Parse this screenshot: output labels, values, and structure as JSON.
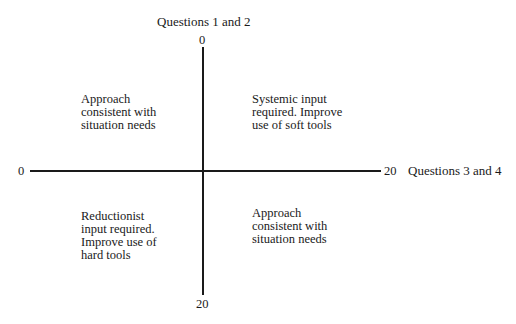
{
  "diagram": {
    "type": "quadrant",
    "vertical_axis": {
      "title": "Questions 1 and 2",
      "top_label": "0",
      "bottom_label": "20"
    },
    "horizontal_axis": {
      "title": "Questions 3 and 4",
      "left_label": "0",
      "right_label": "20"
    },
    "quadrants": {
      "top_left": {
        "lines": [
          "Approach",
          "consistent with",
          "situation needs"
        ]
      },
      "top_right": {
        "lines": [
          "Systemic input",
          "required. Improve",
          "use of soft tools"
        ]
      },
      "bottom_left": {
        "lines": [
          "Reductionist",
          "input required.",
          "Improve use of",
          "hard tools"
        ]
      },
      "bottom_right": {
        "lines": [
          "Approach",
          "consistent with",
          "situation needs"
        ]
      }
    },
    "colors": {
      "ink": "#1a1a1a",
      "background": "#ffffff"
    }
  }
}
